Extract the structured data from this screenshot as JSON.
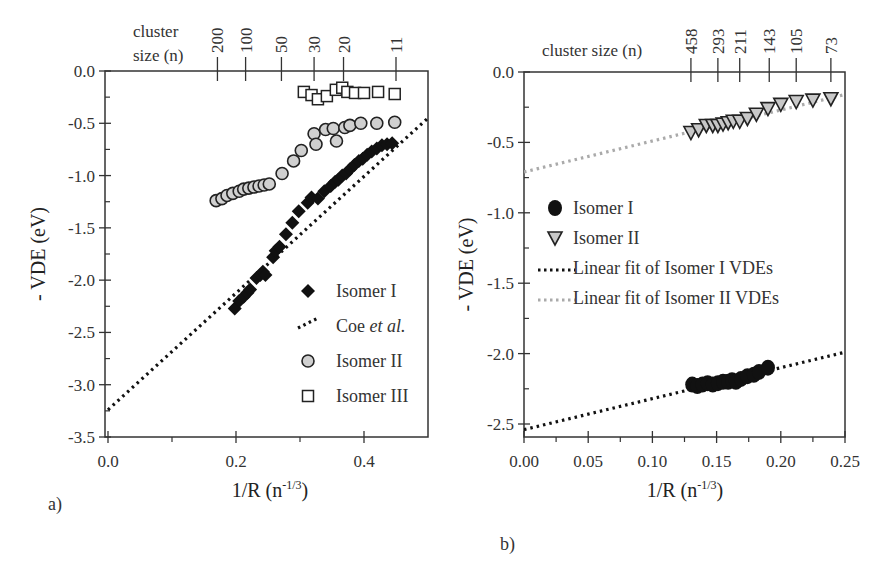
{
  "chart_data": [
    {
      "panel": "a)",
      "type": "scatter",
      "xlabel": "1/R (n^-1/3)",
      "xlabel_main": "1/R (n",
      "xlabel_sup": "-1/3",
      "xlabel_end": ")",
      "ylabel": "- VDE (eV)",
      "xlim": [
        0.0,
        0.5
      ],
      "ylim": [
        -3.5,
        0.0
      ],
      "xticks": [
        "0.0",
        "0.2",
        "0.4"
      ],
      "yticks": [
        "0.0",
        "-0.5",
        "-1.0",
        "-1.5",
        "-2.0",
        "-2.5",
        "-3.0",
        "-3.5"
      ],
      "top_axis": {
        "label_line1": "cluster",
        "label_line2": "size (n)",
        "ticks": [
          {
            "n": "200",
            "x": 0.171
          },
          {
            "n": "100",
            "x": 0.215
          },
          {
            "n": "50",
            "x": 0.271
          },
          {
            "n": "30",
            "x": 0.322
          },
          {
            "n": "20",
            "x": 0.368
          },
          {
            "n": "11",
            "x": 0.45
          }
        ]
      },
      "legend": {
        "position": "lower right",
        "entries": [
          "Isomer I",
          "Coe et al.",
          "Isomer II",
          "Isomer III"
        ]
      },
      "series": [
        {
          "name": "Isomer I",
          "marker": "diamond-filled",
          "color": "#111111",
          "points": [
            [
              0.198,
              -2.27
            ],
            [
              0.205,
              -2.2
            ],
            [
              0.212,
              -2.16
            ],
            [
              0.218,
              -2.12
            ],
            [
              0.222,
              -2.09
            ],
            [
              0.232,
              -1.98
            ],
            [
              0.238,
              -1.95
            ],
            [
              0.242,
              -1.92
            ],
            [
              0.246,
              -1.95
            ],
            [
              0.258,
              -1.78
            ],
            [
              0.262,
              -1.72
            ],
            [
              0.268,
              -1.68
            ],
            [
              0.278,
              -1.56
            ],
            [
              0.288,
              -1.45
            ],
            [
              0.298,
              -1.34
            ],
            [
              0.312,
              -1.26
            ],
            [
              0.318,
              -1.21
            ],
            [
              0.328,
              -1.22
            ],
            [
              0.338,
              -1.15
            ],
            [
              0.348,
              -1.1
            ],
            [
              0.355,
              -1.06
            ],
            [
              0.36,
              -1.04
            ],
            [
              0.366,
              -1.0
            ],
            [
              0.372,
              -0.98
            ],
            [
              0.378,
              -0.94
            ],
            [
              0.385,
              -0.9
            ],
            [
              0.392,
              -0.86
            ],
            [
              0.398,
              -0.84
            ],
            [
              0.405,
              -0.8
            ],
            [
              0.412,
              -0.77
            ],
            [
              0.42,
              -0.74
            ],
            [
              0.428,
              -0.71
            ],
            [
              0.436,
              -0.7
            ],
            [
              0.444,
              -0.69
            ]
          ]
        },
        {
          "name": "Coe et al.",
          "type": "line",
          "style": "dotted",
          "color": "#111111",
          "points": [
            [
              0.0,
              -3.24
            ],
            [
              0.5,
              -0.45
            ]
          ]
        },
        {
          "name": "Isomer II",
          "marker": "circle",
          "color": "#d0d0d0",
          "points": [
            [
              0.169,
              -1.24
            ],
            [
              0.178,
              -1.22
            ],
            [
              0.186,
              -1.19
            ],
            [
              0.195,
              -1.17
            ],
            [
              0.205,
              -1.15
            ],
            [
              0.212,
              -1.13
            ],
            [
              0.22,
              -1.12
            ],
            [
              0.228,
              -1.11
            ],
            [
              0.236,
              -1.1
            ],
            [
              0.244,
              -1.09
            ],
            [
              0.252,
              -1.08
            ],
            [
              0.272,
              -0.98
            ],
            [
              0.29,
              -0.86
            ],
            [
              0.302,
              -0.76
            ],
            [
              0.322,
              -0.6
            ],
            [
              0.325,
              -0.7
            ],
            [
              0.34,
              -0.56
            ],
            [
              0.352,
              -0.55
            ],
            [
              0.357,
              -0.67
            ],
            [
              0.37,
              -0.54
            ],
            [
              0.378,
              -0.52
            ],
            [
              0.395,
              -0.5
            ],
            [
              0.42,
              -0.5
            ],
            [
              0.448,
              -0.49
            ]
          ]
        },
        {
          "name": "Isomer III",
          "marker": "square-open",
          "color": "#ffffff",
          "points": [
            [
              0.306,
              -0.2
            ],
            [
              0.318,
              -0.23
            ],
            [
              0.328,
              -0.27
            ],
            [
              0.342,
              -0.24
            ],
            [
              0.356,
              -0.18
            ],
            [
              0.366,
              -0.16
            ],
            [
              0.374,
              -0.2
            ],
            [
              0.386,
              -0.21
            ],
            [
              0.4,
              -0.21
            ],
            [
              0.422,
              -0.2
            ],
            [
              0.448,
              -0.22
            ]
          ]
        }
      ]
    },
    {
      "panel": "b)",
      "type": "scatter",
      "xlabel": "1/R (n^-1/3)",
      "xlabel_main": "1/R (n",
      "xlabel_sup": "-1/3",
      "xlabel_end": ")",
      "ylabel": "- VDE (eV)",
      "xlim": [
        0.0,
        0.25
      ],
      "ylim": [
        -2.6,
        0.0
      ],
      "xticks": [
        "0.00",
        "0.05",
        "0.10",
        "0.15",
        "0.20",
        "0.25"
      ],
      "yticks": [
        "0.0",
        "-0.5",
        "-1.0",
        "-1.5",
        "-2.0",
        "-2.5"
      ],
      "top_axis": {
        "label": "cluster size (n)",
        "ticks": [
          {
            "n": "458",
            "x": 0.13
          },
          {
            "n": "293",
            "x": 0.151
          },
          {
            "n": "211",
            "x": 0.168
          },
          {
            "n": "143",
            "x": 0.191
          },
          {
            "n": "105",
            "x": 0.212
          },
          {
            "n": "73",
            "x": 0.239
          }
        ]
      },
      "legend": {
        "position": "middle left",
        "entries": [
          "Isomer I",
          "Isomer II",
          "Linear fit of Isomer I VDEs",
          "Linear fit of Isomer II VDEs"
        ]
      },
      "series": [
        {
          "name": "Isomer I",
          "marker": "circle-filled",
          "color": "#111111",
          "points": [
            [
              0.131,
              -2.22
            ],
            [
              0.135,
              -2.23
            ],
            [
              0.139,
              -2.22
            ],
            [
              0.143,
              -2.21
            ],
            [
              0.147,
              -2.22
            ],
            [
              0.151,
              -2.21
            ],
            [
              0.155,
              -2.2
            ],
            [
              0.159,
              -2.2
            ],
            [
              0.162,
              -2.19
            ],
            [
              0.165,
              -2.2
            ],
            [
              0.169,
              -2.18
            ],
            [
              0.174,
              -2.16
            ],
            [
              0.179,
              -2.15
            ],
            [
              0.183,
              -2.13
            ],
            [
              0.19,
              -2.1
            ]
          ]
        },
        {
          "name": "Isomer II",
          "marker": "triangle-down",
          "color": "#c8c8c8",
          "points": [
            [
              0.13,
              -0.43
            ],
            [
              0.136,
              -0.41
            ],
            [
              0.142,
              -0.38
            ],
            [
              0.147,
              -0.38
            ],
            [
              0.151,
              -0.38
            ],
            [
              0.155,
              -0.37
            ],
            [
              0.159,
              -0.36
            ],
            [
              0.163,
              -0.35
            ],
            [
              0.168,
              -0.35
            ],
            [
              0.174,
              -0.33
            ],
            [
              0.181,
              -0.3
            ],
            [
              0.19,
              -0.26
            ],
            [
              0.2,
              -0.23
            ],
            [
              0.212,
              -0.21
            ],
            [
              0.225,
              -0.2
            ],
            [
              0.239,
              -0.19
            ]
          ]
        },
        {
          "name": "Linear fit of Isomer I VDEs",
          "type": "line",
          "style": "dotted",
          "color": "#111111",
          "points": [
            [
              0.0,
              -2.54
            ],
            [
              0.25,
              -1.99
            ]
          ]
        },
        {
          "name": "Linear fit of Isomer II VDEs",
          "type": "line",
          "style": "dotted",
          "color": "#aaaaaa",
          "points": [
            [
              0.0,
              -0.71
            ],
            [
              0.25,
              -0.16
            ]
          ]
        }
      ]
    }
  ]
}
